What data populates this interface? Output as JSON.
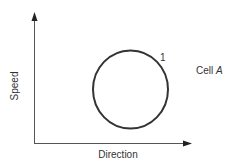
{
  "diagram": {
    "axes": {
      "x_label": "Direction",
      "y_label": "Speed"
    },
    "shapes": [
      {
        "type": "circle",
        "label": "1"
      }
    ],
    "annotation": {
      "prefix": "Cell ",
      "italic": "A"
    },
    "colors": {
      "stroke": "#333333",
      "axis": "#555555",
      "text": "#333333"
    }
  }
}
